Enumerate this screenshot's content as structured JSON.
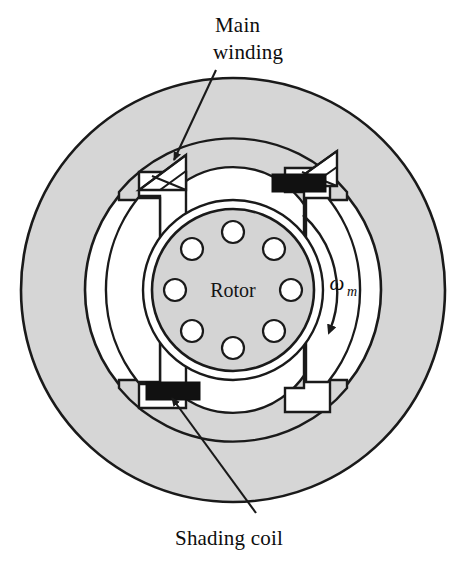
{
  "figure": {
    "background_color": "#ffffff"
  },
  "colors": {
    "stator_fill": "#d6d6d6",
    "pole_fill": "#d6d6d6",
    "rotor_fill": "#d4d4d4",
    "airgap_fill": "#ffffff",
    "slot_fill": "#ffffff",
    "bar_fill": "#ffffff",
    "outline": "#1a1a1a",
    "shading_coil_fill": "#111111",
    "leader_line": "#1a1a1a",
    "text": "#0d0d0d"
  },
  "labels": {
    "main_winding_line1": "Main",
    "main_winding_line2": "winding",
    "shading_coil": "Shading coil",
    "rotor": "Rotor",
    "omega_symbol": "ω",
    "omega_subscript": "m"
  },
  "geometry": {
    "center_x": 233,
    "center_y": 290,
    "stator_outer_radius": 212,
    "stator_inner_radius": 148,
    "rotor_outer_radius": 86,
    "rotor_body_radius": 80,
    "rotor_bar_radius": 58,
    "rotor_bar_circle_radius": 11,
    "rotor_bar_count": 8
  },
  "rotor_bars": [
    {
      "index": 1,
      "angle_deg": 270,
      "cx": 233,
      "cy": 232
    },
    {
      "index": 2,
      "angle_deg": 315,
      "cx": 274,
      "cy": 249
    },
    {
      "index": 3,
      "angle_deg": 0,
      "cx": 291,
      "cy": 290
    },
    {
      "index": 4,
      "angle_deg": 45,
      "cx": 274,
      "cy": 331
    },
    {
      "index": 5,
      "angle_deg": 90,
      "cx": 233,
      "cy": 348
    },
    {
      "index": 6,
      "angle_deg": 135,
      "cx": 192,
      "cy": 331
    },
    {
      "index": 7,
      "angle_deg": 180,
      "cx": 175,
      "cy": 290
    },
    {
      "index": 8,
      "angle_deg": 225,
      "cx": 192,
      "cy": 249
    }
  ],
  "windings": [
    {
      "name": "main-winding-upper-left",
      "type": "cross-hatched-coil",
      "cx": 166,
      "cy": 172
    },
    {
      "name": "main-winding-upper-right",
      "type": "cross-hatched-coil",
      "cx": 313,
      "cy": 167
    }
  ],
  "shading_coils": [
    {
      "name": "shading-coil-upper-right",
      "x": 272,
      "y": 174,
      "width": 52,
      "height": 17
    },
    {
      "name": "shading-coil-lower-left",
      "x": 147,
      "y": 382,
      "width": 52,
      "height": 17
    }
  ],
  "rotation": {
    "direction": "clockwise",
    "symbol": "ωm"
  },
  "leaders": [
    {
      "name": "main-winding-leader",
      "from_x": 213,
      "from_y": 72,
      "to_x": 172,
      "to_y": 158
    },
    {
      "name": "shading-coil-leader",
      "from_x": 253,
      "from_y": 514,
      "to_x": 170,
      "to_y": 395
    }
  ]
}
